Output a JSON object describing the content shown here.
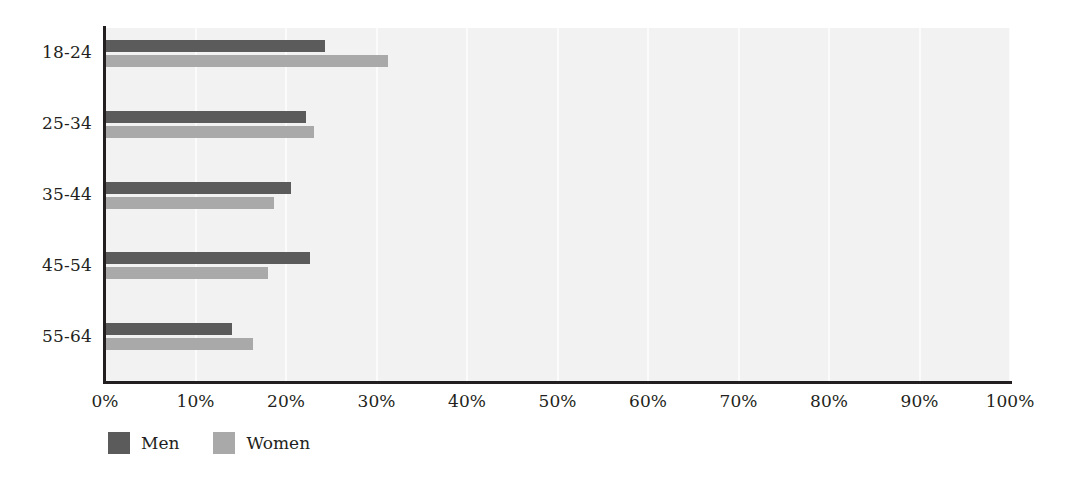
{
  "chart_data": {
    "type": "bar",
    "orientation": "horizontal",
    "title": "",
    "subtitle": "",
    "xlabel": "",
    "ylabel": "",
    "categories": [
      "18-24",
      "25-34",
      "35-44",
      "45-54",
      "55-64"
    ],
    "series": [
      {
        "name": "Men",
        "color": "#5b5b5b",
        "values": [
          24.3,
          22.2,
          20.6,
          22.7,
          14.0
        ]
      },
      {
        "name": "Women",
        "color": "#a9a9a9",
        "values": [
          31.3,
          23.1,
          18.7,
          18.0,
          16.3
        ]
      }
    ],
    "xlim": [
      0,
      100
    ],
    "xticks": [
      0,
      10,
      20,
      30,
      40,
      50,
      60,
      70,
      80,
      90,
      100
    ],
    "xtick_labels": [
      "0%",
      "10%",
      "20%",
      "30%",
      "40%",
      "50%",
      "60%",
      "70%",
      "80%",
      "90%",
      "100%"
    ],
    "tick_suffix": "%",
    "grid": {
      "vertical": true,
      "horizontal": false,
      "color": "#fbfbfb"
    },
    "legend": {
      "position": "bottom-left",
      "entries": [
        "Men",
        "Women"
      ]
    },
    "plot_background": "#f2f2f2",
    "axis_color": "#231f20"
  }
}
